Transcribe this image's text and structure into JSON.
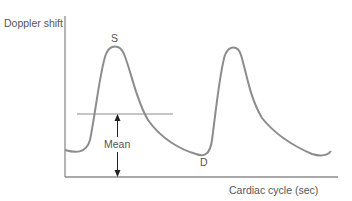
{
  "diagram": {
    "y_axis_label": "Doppler shift",
    "x_axis_label": "Cardiac cycle (sec)",
    "peak_label": "S",
    "trough_label": "D",
    "mean_label": "Mean",
    "colors": {
      "curve": "#8c8c8c",
      "axis": "#8c8c8c",
      "text": "#555555",
      "arrow": "#222222"
    }
  }
}
